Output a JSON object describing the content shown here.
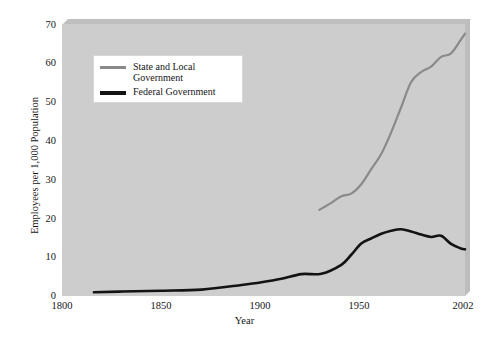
{
  "chart_data": {
    "type": "line",
    "title": "",
    "xlabel": "Year",
    "ylabel": "Employees per 1,000 Population",
    "xlim": [
      1800,
      2002
    ],
    "ylim": [
      0,
      70
    ],
    "xticks": [
      "1800",
      "1850",
      "1900",
      "1950",
      "2002"
    ],
    "xtick_values": [
      1800,
      1850,
      1900,
      1950,
      2002
    ],
    "yticks": [
      "0",
      "10",
      "20",
      "30",
      "40",
      "50",
      "60",
      "70"
    ],
    "ytick_values": [
      0,
      10,
      20,
      30,
      40,
      50,
      60,
      70
    ],
    "grid": false,
    "legend_position": "upper-left-inside",
    "series": [
      {
        "name": "State and Local Government",
        "color": "#8a8a8a",
        "x": [
          1929,
          1935,
          1940,
          1945,
          1950,
          1955,
          1960,
          1965,
          1970,
          1975,
          1980,
          1985,
          1990,
          1995,
          2000,
          2002
        ],
        "values": [
          22.0,
          23.8,
          25.5,
          26.2,
          28.6,
          32.5,
          36.4,
          42.0,
          48.5,
          55.0,
          57.6,
          59.0,
          61.5,
          62.4,
          66.0,
          67.5
        ]
      },
      {
        "name": "Federal Government",
        "color": "#131313",
        "x": [
          1816,
          1830,
          1850,
          1870,
          1890,
          1900,
          1910,
          1920,
          1930,
          1940,
          1945,
          1950,
          1955,
          1960,
          1965,
          1970,
          1975,
          1980,
          1985,
          1990,
          1995,
          2000,
          2002
        ],
        "values": [
          0.7,
          0.9,
          1.1,
          1.4,
          2.6,
          3.3,
          4.2,
          5.4,
          5.5,
          7.8,
          10.4,
          13.3,
          14.6,
          15.8,
          16.6,
          17.0,
          16.4,
          15.6,
          15.0,
          15.3,
          13.2,
          12.0,
          11.8
        ]
      }
    ],
    "legend": [
      {
        "label_line1": "State and Local",
        "label_line2": "Government",
        "color": "#8a8a8a"
      },
      {
        "label_line1": "Federal Government",
        "label_line2": "",
        "color": "#131313"
      }
    ]
  },
  "colors": {
    "panel_background": "#cdcdcd",
    "page_background": "#ffffff",
    "state_line": "#8a8a8a",
    "federal_line": "#131313",
    "text": "#161616"
  }
}
